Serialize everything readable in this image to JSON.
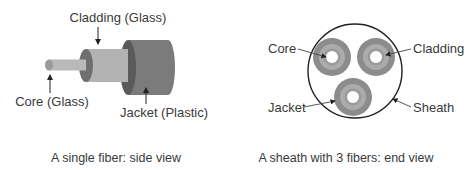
{
  "side_view": {
    "caption": "A single fiber: side view",
    "labels": {
      "cladding": "Cladding (Glass)",
      "core": "Core (Glass)",
      "jacket": "Jacket (Plastic)"
    },
    "colors": {
      "core": "#b9b9b9",
      "core_tip": "#9a9a9a",
      "cladding": "#b3b3b3",
      "cladding_end": "#6f6f6f",
      "jacket": "#7b7b7b",
      "jacket_end": "#5a5a5a"
    }
  },
  "end_view": {
    "caption": "A sheath with 3 fibers: end view",
    "labels": {
      "core": "Core",
      "cladding": "Cladding",
      "jacket": "Jacket",
      "sheath": "Sheath"
    },
    "fiber_count": 3,
    "colors": {
      "jacket": "#8c8c8c",
      "cladding": "#ababab",
      "cladding_inner": "#8f8f8f",
      "core": "#ffffff",
      "sheath_stroke": "#222222"
    }
  }
}
